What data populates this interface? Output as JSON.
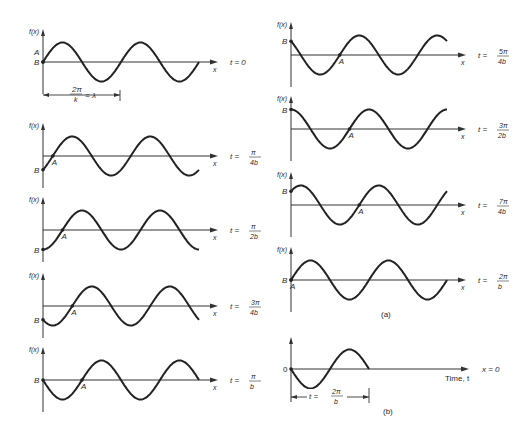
{
  "figure": {
    "wave": {
      "amplitude_px": 19.5,
      "wavelength_px": 78,
      "equation_hint": "f(x,t) = sin(kx - bt)"
    },
    "y_axis_label": "f(x)",
    "x_axis_label": "x",
    "part_a_label": "(a)",
    "part_b_label": "(b)",
    "wavelength_annotation": {
      "numerator": "2π",
      "denominator": "k",
      "rhs": "= λ"
    },
    "panels_left": [
      {
        "id": "t0",
        "t_label": "t = 0",
        "t_num": "",
        "t_den": "",
        "phase": 0,
        "baseline_y": 62,
        "labels": [
          "A",
          "B"
        ],
        "point_A": true
      },
      {
        "id": "t_pi4",
        "t_label": "t =",
        "t_num": "π",
        "t_den": "4b",
        "phase": 0.25,
        "baseline_y": 156,
        "labels": [
          "B"
        ],
        "point_A": true
      },
      {
        "id": "t_pi2",
        "t_label": "t =",
        "t_num": "π",
        "t_den": "2b",
        "phase": 0.5,
        "baseline_y": 230,
        "labels": [
          "B"
        ],
        "point_A": true
      },
      {
        "id": "t_3pi4",
        "t_label": "t =",
        "t_num": "3π",
        "t_den": "4b",
        "phase": 0.75,
        "baseline_y": 306,
        "labels": [
          "B"
        ],
        "point_A": true
      },
      {
        "id": "t_pi",
        "t_label": "t =",
        "t_num": "π",
        "t_den": "b",
        "phase": 1.0,
        "baseline_y": 380,
        "labels": [
          "B"
        ],
        "point_A": true
      }
    ],
    "panels_right": [
      {
        "id": "t_5pi4",
        "t_label": "t =",
        "t_num": "5π",
        "t_den": "4b",
        "phase": 1.25,
        "baseline_y": 55,
        "labels": [
          "B"
        ],
        "point_A": true
      },
      {
        "id": "t_3pi2",
        "t_label": "t =",
        "t_num": "3π",
        "t_den": "2b",
        "phase": 1.5,
        "baseline_y": 129,
        "labels": [
          "B"
        ],
        "point_A": true
      },
      {
        "id": "t_7pi4",
        "t_label": "t =",
        "t_num": "7π",
        "t_den": "4b",
        "phase": 1.75,
        "baseline_y": 205,
        "labels": [
          "B"
        ],
        "point_A": true
      },
      {
        "id": "t_2pi",
        "t_label": "t =",
        "t_num": "2π",
        "t_den": "b",
        "phase": 2.0,
        "baseline_y": 280,
        "labels": [
          "B"
        ],
        "point_A": true
      }
    ],
    "panel_b": {
      "baseline_y": 369,
      "origin_label": "0",
      "x_axis_label": "Time, t",
      "right_label": "x = 0",
      "period_annotation": {
        "lhs": "t =",
        "numerator": "2π",
        "denominator": "b"
      }
    }
  }
}
